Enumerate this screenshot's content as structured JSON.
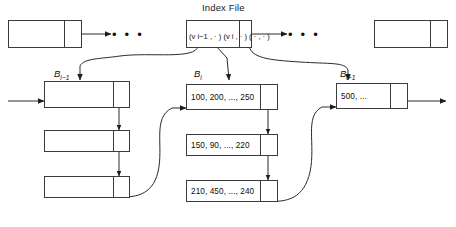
{
  "diagram": {
    "title": "Index File",
    "index_row": {
      "left_box": {
        "label": "",
        "pointer_cell": ""
      },
      "center_box": {
        "entries": [
          {
            "key": "v",
            "key_sub": "i−1",
            "pair": "(vᵢ₋₁, ·)"
          },
          {
            "key": "v",
            "key_sub": "i",
            "pair": "(vᵢ, ·)"
          },
          {
            "key": "",
            "key_sub": "",
            "pair": "( · , · )"
          }
        ],
        "raw_text": "(v i−1 , · ) (v i , · ) ( · , · )",
        "pointer_cell": ""
      },
      "right_box": {
        "label": "",
        "pointer_cell": ""
      },
      "left_ellipsis": "• • •",
      "right_ellipsis": "• • •"
    },
    "buckets": [
      {
        "name": "bucket-prev",
        "label_base": "B",
        "label_sub": "i−1",
        "blocks": [
          {
            "values": ""
          },
          {
            "values": ""
          },
          {
            "values": ""
          }
        ]
      },
      {
        "name": "bucket-current",
        "label_base": "B",
        "label_sub": "i",
        "blocks": [
          {
            "values": "100, 200, ..., 250"
          },
          {
            "values": "150, 90, ..., 220"
          },
          {
            "values": "210, 450, ..., 240"
          }
        ]
      },
      {
        "name": "bucket-next",
        "label_base": "B",
        "label_sub": "i+1",
        "blocks": [
          {
            "values": "500, ..."
          }
        ]
      }
    ],
    "colors": {
      "stroke": "#3b3b3b",
      "line": "#2b2b2b",
      "text": "#0d0d0d",
      "background": "#ffffff"
    }
  }
}
